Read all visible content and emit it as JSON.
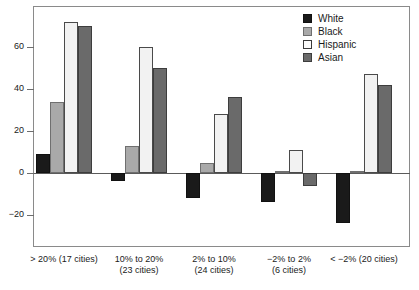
{
  "chart_data": {
    "type": "bar",
    "title": "",
    "subtitle": "",
    "xlabel": "",
    "ylabel": "",
    "ylim": [
      -32,
      78
    ],
    "yticks": [
      60,
      40,
      20,
      0,
      -20
    ],
    "ytick_labels": [
      "60",
      "40",
      "20",
      "0",
      "−20"
    ],
    "grid": false,
    "legend_position": "top-right",
    "categories": [
      "> 20% (17 cities)",
      "10% to 20% (23 cities)",
      "2% to 10% (24 cities)",
      "−2% to 2% (6 cities)",
      "< −2% (20 cities)"
    ],
    "category_lines": [
      [
        "> 20% (17 cities)",
        ""
      ],
      [
        "10% to 20%",
        "(23 cities)"
      ],
      [
        "2% to 10%",
        "(24 cities)"
      ],
      [
        "−2% to 2%",
        "(6 cities)"
      ],
      [
        "< −2% (20 cities)",
        ""
      ]
    ],
    "series": [
      {
        "name": "White",
        "color": "#1a1a1a",
        "values": [
          9,
          -4,
          -12,
          -14,
          -24
        ]
      },
      {
        "name": "Black",
        "color": "#a9a9a9",
        "values": [
          34,
          13,
          5,
          1,
          1
        ]
      },
      {
        "name": "Hispanic",
        "color": "#f2f2f2",
        "values": [
          72,
          60,
          28,
          11,
          47
        ]
      },
      {
        "name": "Asian",
        "color": "#6a6a6a",
        "values": [
          70,
          50,
          36,
          -6,
          42
        ]
      }
    ]
  },
  "legend": {
    "items": [
      {
        "label": "White"
      },
      {
        "label": "Black"
      },
      {
        "label": "Hispanic"
      },
      {
        "label": "Asian"
      }
    ]
  }
}
